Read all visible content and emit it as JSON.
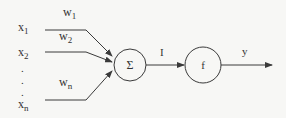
{
  "diagram": {
    "type": "perceptron",
    "inputs": [
      {
        "label": "x",
        "sub": "1"
      },
      {
        "label": "x",
        "sub": "2"
      },
      {
        "label": "x",
        "sub": "n"
      }
    ],
    "weights": [
      {
        "label": "w",
        "sub": "1"
      },
      {
        "label": "w",
        "sub": "2"
      },
      {
        "label": "w",
        "sub": "n"
      }
    ],
    "ellipsis": ".",
    "sum_node": {
      "symbol": "Σ"
    },
    "activation_node": {
      "symbol": "f"
    },
    "intermediate_label": "I",
    "output_label": "y",
    "colors": {
      "line": "#3a3a3a",
      "text": "#333333",
      "background": "#f7f7f5"
    }
  }
}
